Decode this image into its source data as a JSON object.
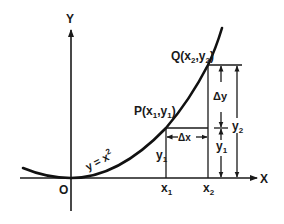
{
  "figure": {
    "axes": {
      "x_label": "X",
      "y_label": "Y",
      "origin_label": "O"
    },
    "curve": {
      "equation_label": "y = x",
      "equation_exponent": "2"
    },
    "points": {
      "P": {
        "name": "P",
        "open": "(",
        "x": "x",
        "x_sub": "1",
        "comma": ",",
        "y": "y",
        "y_sub": "1",
        "close": ")"
      },
      "Q": {
        "name": "Q",
        "open": "(",
        "x": "x",
        "x_sub": "2",
        "comma": ",",
        "y": "y",
        "y_sub": "2",
        "close": ")"
      }
    },
    "x_ticks": [
      {
        "base": "x",
        "sub": "1"
      },
      {
        "base": "x",
        "sub": "2"
      }
    ],
    "dimensions": {
      "delta_x": "Δx",
      "delta_y": "Δy",
      "y1_right": {
        "base": "y",
        "sub": "1"
      },
      "y2_right": {
        "base": "y",
        "sub": "2"
      },
      "y1_left": {
        "base": "y",
        "sub": "1"
      }
    }
  }
}
